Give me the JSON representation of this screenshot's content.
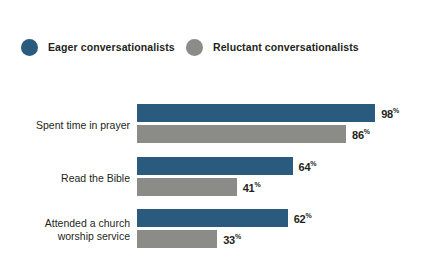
{
  "legend": {
    "items": [
      {
        "label": "Eager conversationalists",
        "color": "#2a5a7d",
        "icon": "legend-dot-icon"
      },
      {
        "label": "Reluctant conversationalists",
        "color": "#8b8b87",
        "icon": "legend-dot-icon"
      }
    ]
  },
  "value_suffix": "%",
  "chart_data": {
    "type": "bar",
    "orientation": "horizontal",
    "title": "",
    "subtitle": "",
    "xlabel": "",
    "ylabel": "",
    "xlim": [
      0,
      100
    ],
    "grid": false,
    "legend_position": "top-left",
    "value_labels": true,
    "value_label_suffix": "%",
    "categories": [
      "Spent time in prayer",
      "Read the Bible",
      "Attended a church\nworship service"
    ],
    "series": [
      {
        "name": "Eager conversationalists",
        "color": "#2a5a7d",
        "values": [
          98,
          64,
          62
        ],
        "labels": [
          "98",
          "64",
          "62"
        ]
      },
      {
        "name": "Reluctant conversationalists",
        "color": "#8b8b87",
        "values": [
          86,
          41,
          33
        ],
        "labels": [
          "86",
          "41",
          "33"
        ]
      }
    ]
  }
}
